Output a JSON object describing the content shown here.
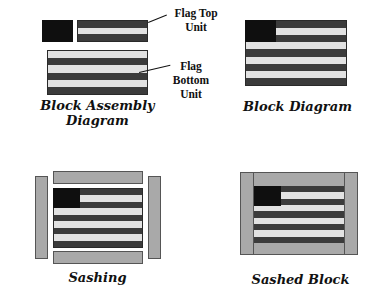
{
  "colors": {
    "navy_canton": "#0f0f0f",
    "dark_stripe": "#3b3b3b",
    "light_stripe": "#e2e2e2",
    "sashing": "#a9a9a9"
  },
  "panels": {
    "block_assembly": {
      "caption_line1": "Block Assembly",
      "caption_line2": "Diagram",
      "top_label_line1": "Flag Top",
      "top_label_line2": "Unit",
      "bottom_label_line1": "Flag",
      "bottom_label_line2": "Bottom",
      "bottom_label_line3": "Unit",
      "top_unit_stripes": [
        "dark",
        "light",
        "dark"
      ],
      "bottom_unit_stripes": [
        "light",
        "dark",
        "light",
        "dark",
        "light",
        "dark"
      ]
    },
    "block_diagram": {
      "caption": "Block Diagram",
      "stripes": [
        "dark",
        "light",
        "dark",
        "light",
        "dark",
        "light",
        "dark",
        "light",
        "dark"
      ]
    },
    "sashing": {
      "caption": "Sashing",
      "pieces": [
        "top-sash",
        "bottom-sash",
        "left-sash",
        "right-sash"
      ]
    },
    "sashed_block": {
      "caption": "Sashed Block"
    }
  }
}
